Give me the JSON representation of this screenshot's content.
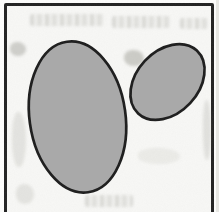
{
  "figure": {
    "type": "scanned-diagram",
    "frame": {
      "border_color": "#212121",
      "paper_color": "#f8f8f6"
    },
    "shapes": {
      "fill": "#a9a9a9",
      "outline": "#1c1c1c",
      "outline_width": 2.7,
      "ellipses": [
        {
          "id": "large-ellipse",
          "cx": 77.5,
          "cy": 117,
          "rx": 48,
          "ry": 76,
          "rotation": -8
        },
        {
          "id": "small-ellipse",
          "cx": 167.5,
          "cy": 82,
          "rx": 43,
          "ry": 31,
          "rotation": -47
        }
      ]
    }
  }
}
